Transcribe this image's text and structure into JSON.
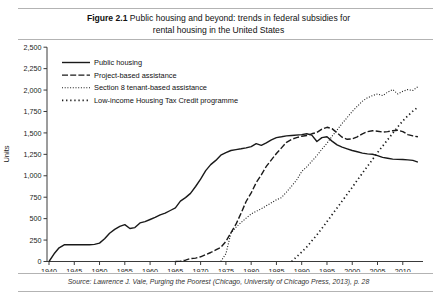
{
  "figure": {
    "fig_label": "Figure 2.1",
    "title_rest_line1": " Public housing and beyond: trends in federal subsidies for",
    "title_line2": "rental housing in the United States",
    "source": "Source: Lawrence J. Vale, Purging the Poorest (Chicago, University of Chicago Press, 2013), p. 28"
  },
  "chart_data": {
    "type": "line",
    "title": "Public housing and beyond: trends in federal subsidies for rental housing in the United States",
    "xlabel": "",
    "ylabel": "Units",
    "ylim": [
      0,
      2500
    ],
    "xlim": [
      1940,
      2014
    ],
    "grid": false,
    "legend_position": "top-left-inside",
    "line_color": "#1a1a1a",
    "y_ticks": [
      {
        "value": 0,
        "label": "0"
      },
      {
        "value": 250,
        "label": "250"
      },
      {
        "value": 500,
        "label": "500"
      },
      {
        "value": 750,
        "label": "750"
      },
      {
        "value": 1000,
        "label": "1,000"
      },
      {
        "value": 1250,
        "label": "1,250"
      },
      {
        "value": 1500,
        "label": "1,500"
      },
      {
        "value": 1750,
        "label": "1,750"
      },
      {
        "value": 2000,
        "label": "2,000"
      },
      {
        "value": 2250,
        "label": "2,250"
      },
      {
        "value": 2500,
        "label": "2,500"
      }
    ],
    "x_ticks": [
      {
        "value": 1940,
        "label": "1940"
      },
      {
        "value": 1945,
        "label": "1945"
      },
      {
        "value": 1950,
        "label": "1950"
      },
      {
        "value": 1955,
        "label": "1955"
      },
      {
        "value": 1960,
        "label": "1960"
      },
      {
        "value": 1965,
        "label": "1965"
      },
      {
        "value": 1970,
        "label": "1970"
      },
      {
        "value": 1975,
        "label": "1975"
      },
      {
        "value": 1980,
        "label": "1980"
      },
      {
        "value": 1985,
        "label": "1985"
      },
      {
        "value": 1990,
        "label": "1990"
      },
      {
        "value": 1995,
        "label": "1995"
      },
      {
        "value": 2000,
        "label": "2000"
      },
      {
        "value": 2005,
        "label": "2005"
      },
      {
        "value": 2010,
        "label": "2010"
      }
    ],
    "series": [
      {
        "name": "Public housing",
        "style": "solid",
        "points": [
          [
            1940,
            0
          ],
          [
            1941,
            90
          ],
          [
            1942,
            160
          ],
          [
            1943,
            195
          ],
          [
            1944,
            195
          ],
          [
            1946,
            195
          ],
          [
            1948,
            195
          ],
          [
            1949,
            200
          ],
          [
            1950,
            215
          ],
          [
            1951,
            265
          ],
          [
            1952,
            330
          ],
          [
            1953,
            375
          ],
          [
            1954,
            410
          ],
          [
            1955,
            430
          ],
          [
            1956,
            385
          ],
          [
            1957,
            395
          ],
          [
            1958,
            450
          ],
          [
            1959,
            465
          ],
          [
            1960,
            490
          ],
          [
            1961,
            515
          ],
          [
            1962,
            545
          ],
          [
            1963,
            565
          ],
          [
            1964,
            595
          ],
          [
            1965,
            625
          ],
          [
            1966,
            705
          ],
          [
            1967,
            745
          ],
          [
            1968,
            795
          ],
          [
            1969,
            875
          ],
          [
            1970,
            960
          ],
          [
            1971,
            1060
          ],
          [
            1972,
            1130
          ],
          [
            1973,
            1180
          ],
          [
            1974,
            1240
          ],
          [
            1975,
            1270
          ],
          [
            1976,
            1295
          ],
          [
            1977,
            1305
          ],
          [
            1978,
            1315
          ],
          [
            1979,
            1325
          ],
          [
            1980,
            1340
          ],
          [
            1981,
            1375
          ],
          [
            1982,
            1355
          ],
          [
            1983,
            1385
          ],
          [
            1984,
            1420
          ],
          [
            1985,
            1445
          ],
          [
            1986,
            1455
          ],
          [
            1987,
            1465
          ],
          [
            1988,
            1470
          ],
          [
            1990,
            1480
          ],
          [
            1991,
            1490
          ],
          [
            1992,
            1475
          ],
          [
            1993,
            1400
          ],
          [
            1994,
            1445
          ],
          [
            1995,
            1455
          ],
          [
            1996,
            1405
          ],
          [
            1997,
            1360
          ],
          [
            1998,
            1335
          ],
          [
            1999,
            1315
          ],
          [
            2000,
            1295
          ],
          [
            2001,
            1280
          ],
          [
            2002,
            1265
          ],
          [
            2003,
            1255
          ],
          [
            2004,
            1250
          ],
          [
            2005,
            1235
          ],
          [
            2006,
            1215
          ],
          [
            2007,
            1205
          ],
          [
            2008,
            1195
          ],
          [
            2010,
            1190
          ],
          [
            2011,
            1185
          ],
          [
            2012,
            1180
          ],
          [
            2013,
            1160
          ]
        ]
      },
      {
        "name": "Project-based assistance",
        "style": "dashed",
        "points": [
          [
            1965,
            0
          ],
          [
            1966,
            5
          ],
          [
            1967,
            15
          ],
          [
            1968,
            35
          ],
          [
            1969,
            40
          ],
          [
            1970,
            55
          ],
          [
            1971,
            80
          ],
          [
            1972,
            105
          ],
          [
            1973,
            135
          ],
          [
            1974,
            165
          ],
          [
            1975,
            235
          ],
          [
            1976,
            335
          ],
          [
            1977,
            435
          ],
          [
            1978,
            565
          ],
          [
            1979,
            700
          ],
          [
            1980,
            800
          ],
          [
            1981,
            920
          ],
          [
            1982,
            1010
          ],
          [
            1983,
            1110
          ],
          [
            1984,
            1185
          ],
          [
            1985,
            1260
          ],
          [
            1986,
            1325
          ],
          [
            1987,
            1390
          ],
          [
            1988,
            1425
          ],
          [
            1989,
            1445
          ],
          [
            1990,
            1460
          ],
          [
            1991,
            1470
          ],
          [
            1992,
            1490
          ],
          [
            1993,
            1505
          ],
          [
            1994,
            1545
          ],
          [
            1995,
            1565
          ],
          [
            1996,
            1550
          ],
          [
            1997,
            1500
          ],
          [
            1998,
            1450
          ],
          [
            1999,
            1425
          ],
          [
            2000,
            1430
          ],
          [
            2001,
            1455
          ],
          [
            2002,
            1490
          ],
          [
            2003,
            1515
          ],
          [
            2004,
            1525
          ],
          [
            2005,
            1520
          ],
          [
            2006,
            1510
          ],
          [
            2007,
            1515
          ],
          [
            2008,
            1525
          ],
          [
            2009,
            1530
          ],
          [
            2010,
            1515
          ],
          [
            2011,
            1480
          ],
          [
            2012,
            1465
          ],
          [
            2013,
            1455
          ]
        ]
      },
      {
        "name": "Section 8 tenant-based assistance",
        "style": "dotted-fine",
        "points": [
          [
            1974,
            0
          ],
          [
            1975,
            90
          ],
          [
            1976,
            330
          ],
          [
            1977,
            400
          ],
          [
            1978,
            455
          ],
          [
            1979,
            505
          ],
          [
            1980,
            555
          ],
          [
            1981,
            585
          ],
          [
            1982,
            615
          ],
          [
            1983,
            650
          ],
          [
            1984,
            685
          ],
          [
            1985,
            720
          ],
          [
            1986,
            745
          ],
          [
            1987,
            810
          ],
          [
            1988,
            880
          ],
          [
            1989,
            950
          ],
          [
            1990,
            1050
          ],
          [
            1991,
            1105
          ],
          [
            1992,
            1170
          ],
          [
            1993,
            1235
          ],
          [
            1994,
            1310
          ],
          [
            1995,
            1380
          ],
          [
            1996,
            1460
          ],
          [
            1997,
            1535
          ],
          [
            1998,
            1610
          ],
          [
            1999,
            1680
          ],
          [
            2000,
            1750
          ],
          [
            2001,
            1810
          ],
          [
            2002,
            1870
          ],
          [
            2003,
            1910
          ],
          [
            2004,
            1935
          ],
          [
            2005,
            1955
          ],
          [
            2006,
            1935
          ],
          [
            2007,
            1975
          ],
          [
            2008,
            2005
          ],
          [
            2009,
            1955
          ],
          [
            2010,
            1985
          ],
          [
            2011,
            2005
          ],
          [
            2012,
            1995
          ],
          [
            2013,
            2040
          ]
        ]
      },
      {
        "name": "Low-income Housing Tax Credit programme",
        "style": "dotted-coarse",
        "points": [
          [
            1988,
            0
          ],
          [
            1989,
            55
          ],
          [
            1990,
            110
          ],
          [
            1991,
            170
          ],
          [
            1992,
            240
          ],
          [
            1993,
            310
          ],
          [
            1994,
            385
          ],
          [
            1995,
            465
          ],
          [
            1996,
            545
          ],
          [
            1997,
            625
          ],
          [
            1998,
            705
          ],
          [
            1999,
            785
          ],
          [
            2000,
            865
          ],
          [
            2001,
            950
          ],
          [
            2002,
            1030
          ],
          [
            2003,
            1110
          ],
          [
            2004,
            1190
          ],
          [
            2005,
            1270
          ],
          [
            2006,
            1345
          ],
          [
            2007,
            1420
          ],
          [
            2008,
            1495
          ],
          [
            2009,
            1570
          ],
          [
            2010,
            1640
          ],
          [
            2011,
            1700
          ],
          [
            2012,
            1755
          ],
          [
            2013,
            1800
          ]
        ]
      }
    ]
  }
}
